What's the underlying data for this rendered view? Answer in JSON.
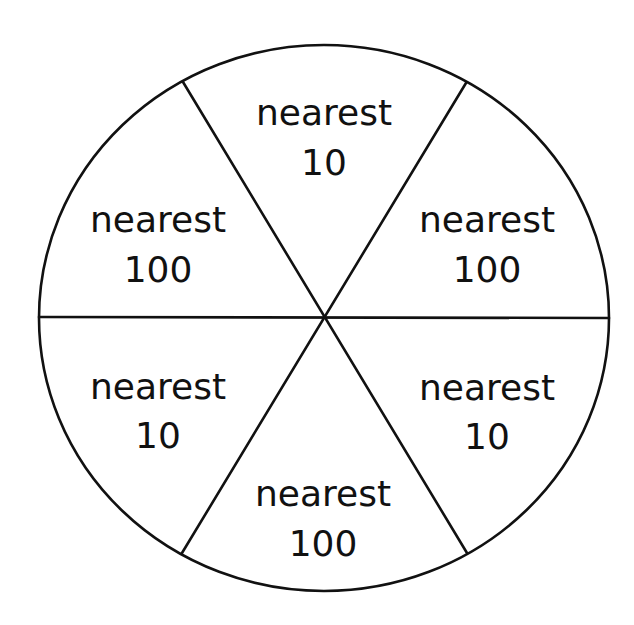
{
  "diagram": {
    "type": "spinner",
    "sections": [
      {
        "position": "top",
        "line1": "nearest",
        "line2": "10",
        "x": 324,
        "y1": 125,
        "y2": 175
      },
      {
        "position": "upper-right",
        "line1": "nearest",
        "line2": "100",
        "x": 487,
        "y1": 232,
        "y2": 282
      },
      {
        "position": "lower-right",
        "line1": "nearest",
        "line2": "10",
        "x": 487,
        "y1": 400,
        "y2": 449
      },
      {
        "position": "bottom",
        "line1": "nearest",
        "line2": "100",
        "x": 323,
        "y1": 506,
        "y2": 556
      },
      {
        "position": "lower-left",
        "line1": "nearest",
        "line2": "10",
        "x": 158,
        "y1": 399,
        "y2": 448
      },
      {
        "position": "upper-left",
        "line1": "nearest",
        "line2": "100",
        "x": 158,
        "y1": 232,
        "y2": 282
      }
    ],
    "colors": {
      "stroke": "#111111",
      "fill": "#ffffff",
      "text": "#111111"
    }
  }
}
